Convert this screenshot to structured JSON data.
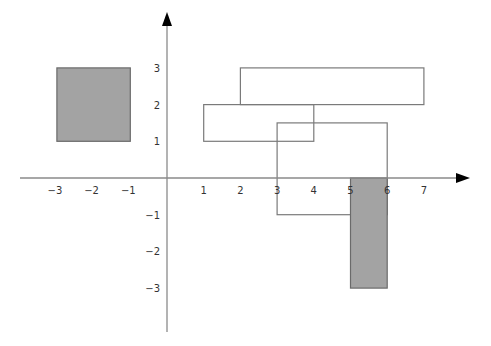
{
  "diagram": {
    "title": "",
    "colors": {
      "background": "#ffffff",
      "axis": "#8a8a8a",
      "arrowhead": "#000000",
      "outline": "#7a7a7a",
      "shaded_fill": "#a3a3a3",
      "shaded_stroke": "#6a6a6a",
      "label": "#333333"
    },
    "axes": {
      "origin_px": [
        167,
        178
      ],
      "unit_px": 36.7,
      "x_axis": {
        "start_px": 20,
        "end_px": 470,
        "tick_labels": [
          "−3",
          "−2",
          "−1",
          "1",
          "2",
          "3",
          "4",
          "5",
          "6",
          "7"
        ],
        "tick_values": [
          -3,
          -2,
          -1,
          1,
          2,
          3,
          4,
          5,
          6,
          7
        ]
      },
      "y_axis": {
        "start_px": 332,
        "end_px": 12,
        "tick_labels": [
          "3",
          "2",
          "1",
          "−1",
          "−2",
          "−3"
        ],
        "tick_values": [
          3,
          2,
          1,
          -1,
          -2,
          -3
        ]
      }
    },
    "rectangles": [
      {
        "name": "shaded-square-left",
        "x1": -3,
        "y1": 1,
        "x2": -1,
        "y2": 3,
        "shaded": true
      },
      {
        "name": "outline-rect-top",
        "x1": 2,
        "y1": 2,
        "x2": 7,
        "y2": 3,
        "shaded": false
      },
      {
        "name": "outline-rect-middle",
        "x1": 1,
        "y1": 1,
        "x2": 4,
        "y2": 2,
        "shaded": false
      },
      {
        "name": "outline-rect-large",
        "x1": 3,
        "y1": -1,
        "x2": 6,
        "y2": 1.5,
        "shaded": false
      },
      {
        "name": "shaded-rect-vertical",
        "x1": 5,
        "y1": -3,
        "x2": 6,
        "y2": 0,
        "shaded": true
      }
    ]
  }
}
